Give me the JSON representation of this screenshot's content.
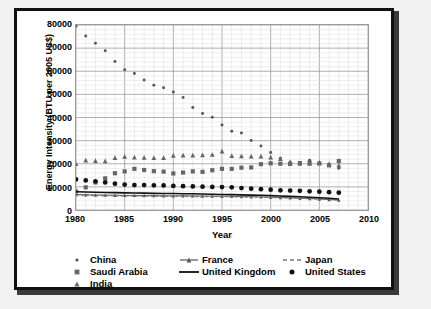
{
  "chart_data": {
    "type": "scatter",
    "title": "",
    "xlabel": "Year",
    "ylabel": "Energy Intensity (BTU per 2005 US$)",
    "xlim": [
      1980,
      2010
    ],
    "ylim": [
      0,
      80000
    ],
    "xticks": [
      1980,
      1985,
      1990,
      1995,
      2000,
      2005,
      2010
    ],
    "yticks": [
      0,
      10000,
      20000,
      30000,
      40000,
      50000,
      60000,
      70000,
      80000
    ],
    "grid": true,
    "legend_position": "bottom",
    "x": [
      1980,
      1981,
      1982,
      1983,
      1984,
      1985,
      1986,
      1987,
      1988,
      1989,
      1990,
      1991,
      1992,
      1993,
      1994,
      1995,
      1996,
      1997,
      1998,
      1999,
      2000,
      2001,
      2002,
      2003,
      2004,
      2005,
      2006,
      2007
    ],
    "series": [
      {
        "name": "China",
        "marker": "dot-small",
        "color": "#555555",
        "values": [
          79500,
          75200,
          72100,
          68900,
          64200,
          60700,
          59000,
          56200,
          54000,
          52900,
          51000,
          48700,
          44300,
          41700,
          40100,
          36800,
          34100,
          33300,
          30100,
          27700,
          24900,
          22400,
          20700,
          20200,
          21500,
          20200,
          19200,
          18100
        ]
      },
      {
        "name": "France",
        "marker": "line-triangle",
        "color": "#555555",
        "values": [
          6700,
          6600,
          6500,
          6450,
          6400,
          6300,
          6300,
          6250,
          6200,
          6150,
          6100,
          6150,
          6100,
          6050,
          6000,
          5950,
          5900,
          5800,
          5750,
          5650,
          5500,
          5400,
          5250,
          5100,
          4950,
          4750,
          4500,
          4300
        ]
      },
      {
        "name": "Japan",
        "marker": "dashed-line",
        "color": "#777777",
        "values": [
          6500,
          6400,
          6300,
          6200,
          6150,
          6100,
          6050,
          6000,
          5950,
          5900,
          5850,
          5850,
          5800,
          5800,
          5800,
          5750,
          5700,
          5600,
          5550,
          5500,
          5400,
          5300,
          5200,
          5050,
          4900,
          4750,
          4550,
          4350
        ]
      },
      {
        "name": "Saudi Arabia",
        "marker": "square",
        "color": "#666666",
        "values": [
          8000,
          9800,
          11900,
          13700,
          15900,
          16700,
          17800,
          17300,
          16800,
          16600,
          15800,
          16200,
          16700,
          16500,
          17200,
          17800,
          17800,
          18300,
          18400,
          19800,
          20200,
          20000,
          19900,
          20300,
          20400,
          20100,
          19300,
          21200
        ]
      },
      {
        "name": "United Kingdom",
        "marker": "solid-line",
        "color": "#111111",
        "values": [
          7900,
          7800,
          7700,
          7600,
          7500,
          7400,
          7350,
          7300,
          7200,
          7150,
          7100,
          7050,
          7000,
          6900,
          6800,
          6700,
          6650,
          6550,
          6450,
          6350,
          6200,
          6050,
          5900,
          5750,
          5550,
          5300,
          5050,
          4750
        ]
      },
      {
        "name": "United States",
        "marker": "circle",
        "color": "#111111",
        "values": [
          13200,
          12800,
          12400,
          11900,
          11400,
          11000,
          10800,
          10800,
          10700,
          10600,
          10400,
          10300,
          10200,
          10100,
          10000,
          9900,
          9800,
          9500,
          9200,
          9000,
          8800,
          8500,
          8400,
          8300,
          8100,
          7900,
          7700,
          7500
        ]
      },
      {
        "name": "India",
        "marker": "triangle",
        "color": "#666666",
        "values": [
          20000,
          21600,
          21400,
          21200,
          22700,
          23200,
          22900,
          22800,
          22700,
          22700,
          23600,
          23700,
          23700,
          23800,
          24000,
          25500,
          23500,
          23400,
          23300,
          23300,
          22900,
          22200,
          20800,
          20200,
          20200,
          20600,
          20100,
          19400
        ]
      }
    ]
  },
  "axis": {
    "y_title": "Energy Intensity (BTU per 2005 US$)",
    "x_title": "Year",
    "y_tick_labels": [
      "80000",
      "70000",
      "60000",
      "50000",
      "40000",
      "30000",
      "20000",
      "10000",
      "0"
    ],
    "x_tick_labels": [
      "1980",
      "1985",
      "1990",
      "1995",
      "2000",
      "2005",
      "2010"
    ]
  },
  "legend": {
    "items": [
      {
        "label": "China",
        "marker": "dot-small"
      },
      {
        "label": "France",
        "marker": "line-triangle"
      },
      {
        "label": "Japan",
        "marker": "dashed-line"
      },
      {
        "label": "Saudi Arabia",
        "marker": "square"
      },
      {
        "label": "United Kingdom",
        "marker": "solid-line"
      },
      {
        "label": "United States",
        "marker": "circle"
      },
      {
        "label": "India",
        "marker": "triangle"
      }
    ]
  }
}
